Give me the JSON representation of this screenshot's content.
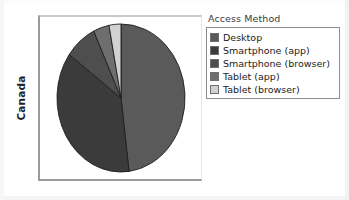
{
  "axis": {
    "y_label": "Canada"
  },
  "legend": {
    "title": "Access Method",
    "items": [
      {
        "label": "Desktop",
        "color": "#5a5a5a",
        "swatch_name": "legend-swatch-desktop"
      },
      {
        "label": "Smartphone (app)",
        "color": "#3b3b3b",
        "swatch_name": "legend-swatch-smartphone-app"
      },
      {
        "label": "Smartphone (browser)",
        "color": "#4e4e4e",
        "swatch_name": "legend-swatch-smartphone-browser"
      },
      {
        "label": "Tablet (app)",
        "color": "#6e6e6e",
        "swatch_name": "legend-swatch-tablet-app"
      },
      {
        "label": "Tablet (browser)",
        "color": "#d2d2d2",
        "swatch_name": "legend-swatch-tablet-browser"
      }
    ]
  },
  "chart_data": {
    "type": "pie",
    "title": "",
    "xlabel": "",
    "ylabel": "Canada",
    "legend_title": "Access Method",
    "legend_position": "right",
    "grid": false,
    "start_angle_deg": 0,
    "direction": "clockwise",
    "categories": [
      "Desktop",
      "Smartphone (app)",
      "Smartphone (browser)",
      "Tablet (app)",
      "Tablet (browser)"
    ],
    "values": [
      48,
      37,
      8,
      4,
      3
    ],
    "unit": "percent",
    "colors": [
      "#5a5a5a",
      "#3b3b3b",
      "#4e4e4e",
      "#6e6e6e",
      "#d2d2d2"
    ],
    "slice_border_color": "#1e1e1e"
  }
}
